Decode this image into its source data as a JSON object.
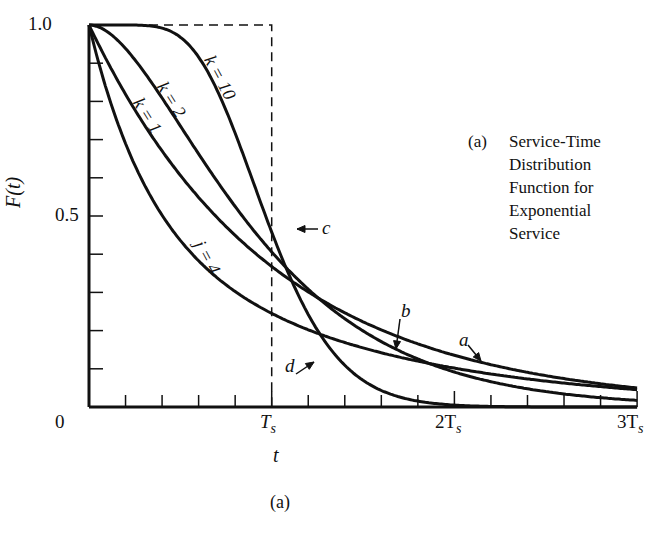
{
  "chart_data": {
    "type": "line",
    "subtitle": "(a)",
    "xlabel": "t",
    "ylabel": "F(t)",
    "x_ticks": [
      "0",
      "Ts",
      "2Ts",
      "3Ts"
    ],
    "y_ticks": [
      "0",
      "0.5",
      "1.0"
    ],
    "xlim": [
      0,
      3
    ],
    "ylim": [
      0,
      1
    ],
    "x_unit": "Ts",
    "minor_x_ticks_per_Ts": 5,
    "minor_y_tick_step": 0.1,
    "grid": false,
    "series": [
      {
        "name": "k = 1",
        "marker": "a",
        "kind": "exponential (Erlang k=1)",
        "x": [
          0,
          0.25,
          0.5,
          0.75,
          1.0,
          1.25,
          1.5,
          1.75,
          2.0,
          2.5,
          3.0
        ],
        "values": [
          1.0,
          0.78,
          0.61,
          0.47,
          0.37,
          0.29,
          0.22,
          0.17,
          0.14,
          0.08,
          0.05
        ]
      },
      {
        "name": "k = 2",
        "marker": "b",
        "kind": "Erlang k=2",
        "x": [
          0,
          0.25,
          0.5,
          0.75,
          1.0,
          1.25,
          1.5,
          1.75,
          2.0,
          2.5,
          3.0
        ],
        "values": [
          1.0,
          0.91,
          0.74,
          0.56,
          0.41,
          0.29,
          0.2,
          0.14,
          0.09,
          0.04,
          0.02
        ]
      },
      {
        "name": "k = 10",
        "marker": "c",
        "kind": "Erlang k=10",
        "x": [
          0,
          0.25,
          0.5,
          0.75,
          1.0,
          1.25,
          1.5,
          1.75,
          2.0,
          2.5,
          3.0
        ],
        "values": [
          1.0,
          1.0,
          0.97,
          0.82,
          0.58,
          0.31,
          0.12,
          0.04,
          0.01,
          0.0,
          0.0
        ]
      },
      {
        "name": "j = 4",
        "marker": "d",
        "kind": "hyperexponential j=4",
        "x": [
          0,
          0.25,
          0.5,
          0.75,
          1.0,
          1.25,
          1.5,
          1.75,
          2.0,
          2.5,
          3.0
        ],
        "values": [
          1.0,
          0.63,
          0.43,
          0.31,
          0.25,
          0.2,
          0.17,
          0.14,
          0.12,
          0.08,
          0.05
        ]
      },
      {
        "name": "deterministic",
        "marker": "",
        "kind": "constant service time (dashed step at Ts)",
        "x": [
          0,
          1.0,
          1.0,
          3.0
        ],
        "values": [
          1.0,
          1.0,
          0.0,
          0.0
        ]
      }
    ],
    "annotations": [
      "a",
      "b",
      "c",
      "d",
      "k = 1",
      "k = 2",
      "k = 10",
      "j = 4"
    ]
  },
  "labels": {
    "y_top": "1.0",
    "y_mid": "0.5",
    "x_zero": "0",
    "x_ts": "T",
    "x_2ts": "2T",
    "x_3ts": "3T",
    "sub_s": "s",
    "x_axis": "t",
    "y_axis": "F(t)",
    "figure_tag": "(a)",
    "curve_k1": "k = 1",
    "curve_k2": "k = 2",
    "curve_k10": "k = 10",
    "curve_j4": "j = 4",
    "marker_a": "a",
    "marker_b": "b",
    "marker_c": "c",
    "marker_d": "d"
  },
  "caption": {
    "tag": "(a)",
    "lines": [
      "Service-Time",
      "Distribution",
      "Function for",
      "Exponential",
      "Service"
    ]
  }
}
